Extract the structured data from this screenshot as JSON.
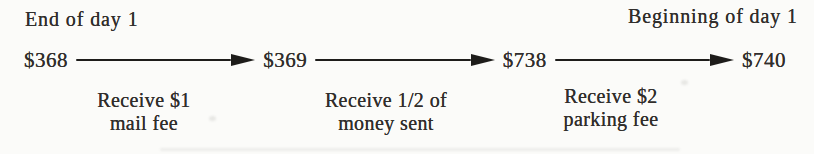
{
  "diagram": {
    "top_labels": {
      "left": "End of day 1",
      "right": "Beginning of day 1"
    },
    "amounts": [
      "$368",
      "$369",
      "$738",
      "$740"
    ],
    "steps": [
      {
        "line1": "Receive $1",
        "line2": "mail fee"
      },
      {
        "line1": "Receive 1/2 of",
        "line2": "money sent"
      },
      {
        "line1": "Receive $2",
        "line2": "parking fee"
      }
    ],
    "colors": {
      "text": "#312e2c",
      "arrow": "#1d1c1a",
      "background": "#fbfbf9"
    }
  }
}
